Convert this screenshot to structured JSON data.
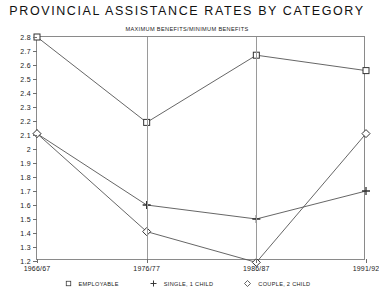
{
  "chart_data": {
    "type": "line",
    "title": "PROVINCIAL ASSISTANCE RATES BY CATEGORY",
    "subtitle": "MAXIMUM BENEFITS/MINIMUM BENEFITS",
    "xlabel": "",
    "ylabel": "",
    "categories": [
      "1966/67",
      "1976/77",
      "1986/87",
      "1991/92"
    ],
    "ylim": [
      1.2,
      2.8
    ],
    "ytick_labels": [
      "2.8",
      "2.7",
      "2.6",
      "2.5",
      "2.4",
      "2.3",
      "2.2",
      "2.1",
      "2",
      "1.9",
      "1.8",
      "1.7",
      "1.6",
      "1.5",
      "1.4",
      "1.3",
      "1.2"
    ],
    "ytick_values": [
      2.8,
      2.7,
      2.6,
      2.5,
      2.4,
      2.3,
      2.2,
      2.1,
      2.0,
      1.9,
      1.8,
      1.7,
      1.6,
      1.5,
      1.4,
      1.3,
      1.2
    ],
    "grid": false,
    "legend_position": "bottom",
    "series": [
      {
        "name": "EMPLOYABLE",
        "marker": "square",
        "values": [
          2.8,
          2.19,
          2.67,
          2.56
        ]
      },
      {
        "name": "SINGLE, 1 CHILD",
        "marker": "plus",
        "values": [
          2.11,
          1.6,
          1.5,
          1.7
        ]
      },
      {
        "name": "COUPLE, 2 CHILD",
        "marker": "diamond",
        "values": [
          2.11,
          1.41,
          1.19,
          2.11
        ]
      }
    ]
  },
  "legend": {
    "items": [
      {
        "label": "EMPLOYABLE",
        "icon": "square-marker-icon"
      },
      {
        "label": "SINGLE, 1 CHILD",
        "icon": "plus-marker-icon"
      },
      {
        "label": "COUPLE, 2 CHILD",
        "icon": "diamond-marker-icon"
      }
    ]
  }
}
